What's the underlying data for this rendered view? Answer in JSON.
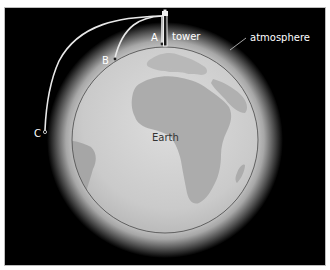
{
  "diagram": {
    "labels": {
      "earth": "Earth",
      "atmosphere": "atmosphere",
      "tower": "tower",
      "point_a": "A",
      "point_b": "B",
      "point_c": "C"
    },
    "colors": {
      "background": "#000000",
      "frame_border": "#bdbdbd",
      "atmosphere_glow": "#e6e6e6",
      "ocean": "#cfcfcf",
      "land": "#a9a9a9",
      "earth_outline": "#555555",
      "trajectory": "#e8e8e8",
      "label_light": "#ffffff",
      "label_dark": "#333333"
    }
  }
}
